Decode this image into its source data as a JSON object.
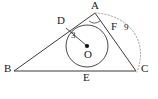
{
  "figure": {
    "background_color": "#ffffff",
    "stroke_color": "#3a3a3a",
    "label_color": "#1a1a1a",
    "width": 158,
    "height": 99
  },
  "labels": {
    "A": "A",
    "B": "B",
    "C": "C",
    "D": "D",
    "E": "E",
    "F": "F",
    "O": "O",
    "radius_value": "3",
    "side_value": "9"
  },
  "geometry": {
    "type": "triangle-with-incircle",
    "vertices": {
      "A": [
        95,
        13
      ],
      "B": [
        14,
        71
      ],
      "C": [
        136,
        71
      ]
    },
    "incircle": {
      "center": [
        87,
        46
      ],
      "center_label": "O",
      "radius": 21,
      "radius_label": "3"
    },
    "tangent_points": {
      "D": [
        66,
        28
      ],
      "F": [
        112,
        31
      ],
      "E": [
        87,
        67
      ]
    },
    "radius_segment": {
      "from": "D",
      "to": "O",
      "label": "3"
    },
    "angle_mark": {
      "at": "A",
      "kind": "arc"
    },
    "dotted_arc": {
      "from": "A",
      "to": "C",
      "style": "dotted",
      "label": "9"
    }
  }
}
